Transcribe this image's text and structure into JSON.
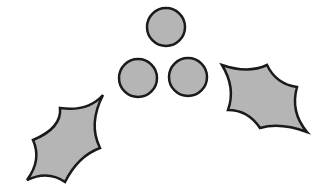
{
  "illustration": {
    "subject": "holly",
    "fill_color": "#b5b5b5",
    "stroke_color": "#1a1a1a",
    "berries": [
      {
        "cx": 166,
        "cy": 27,
        "r": 19
      },
      {
        "cx": 138,
        "cy": 78,
        "r": 19
      },
      {
        "cx": 188,
        "cy": 77,
        "r": 19
      }
    ],
    "leaves": [
      {
        "name": "left-leaf"
      },
      {
        "name": "right-leaf"
      }
    ]
  }
}
